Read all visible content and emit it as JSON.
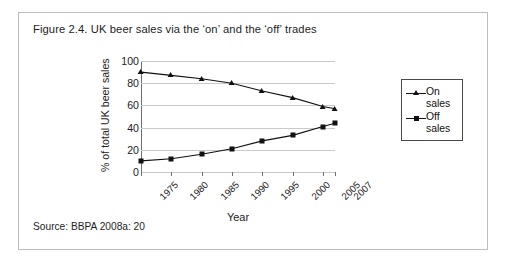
{
  "figure": {
    "title": "Figure 2.4. UK beer sales via the ‘on’ and the ‘off’ trades",
    "source": "Source: BBPA 2008a: 20"
  },
  "chart_data": {
    "type": "line",
    "title": "",
    "xlabel": "Year",
    "ylabel": "% of total UK beer sales",
    "categories": [
      "1975",
      "1980",
      "1985",
      "1990",
      "1995",
      "2000",
      "2005",
      "2007"
    ],
    "x": [
      1975,
      1980,
      1985,
      1990,
      1995,
      2000,
      2005,
      2007
    ],
    "series": [
      {
        "name": "On sales",
        "marker": "triangle",
        "values": [
          90,
          87,
          84,
          80,
          73,
          67,
          59,
          57
        ]
      },
      {
        "name": "Off sales",
        "marker": "square",
        "values": [
          10,
          12,
          16,
          21,
          28,
          33,
          41,
          44
        ]
      }
    ],
    "ylim": [
      0,
      100
    ],
    "yticks": [
      0,
      20,
      40,
      60,
      80,
      100
    ],
    "ytick_labels": [
      "0",
      "20",
      "40",
      "60",
      "80",
      "100"
    ],
    "grid": true,
    "legend_position": "right",
    "legend": [
      {
        "line1": "On",
        "line2": "sales"
      },
      {
        "line1": "Off",
        "line2": "sales"
      }
    ],
    "colors": {
      "series": "#111111",
      "grid": "#c9c9c9",
      "axis": "#6f6f6f",
      "border": "#bdbdbd"
    }
  }
}
